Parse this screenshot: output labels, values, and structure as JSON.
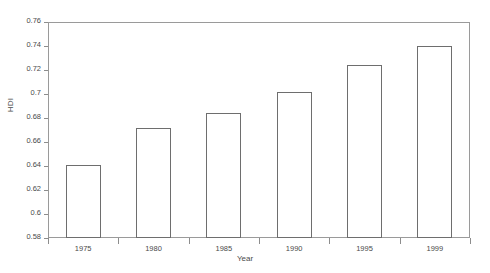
{
  "chart_data": {
    "type": "bar",
    "title": "",
    "xlabel": "Year",
    "ylabel": "HDI",
    "categories": [
      "1975",
      "1980",
      "1985",
      "1990",
      "1995",
      "1999"
    ],
    "values": [
      0.641,
      0.672,
      0.684,
      0.702,
      0.724,
      0.74
    ],
    "ylim": [
      0.58,
      0.76
    ],
    "yticks": [
      "0.58",
      "0.6",
      "0.62",
      "0.64",
      "0.66",
      "0.68",
      "0.7",
      "0.72",
      "0.74",
      "0.76"
    ],
    "ytick_values": [
      0.58,
      0.6,
      0.62,
      0.64,
      0.66,
      0.68,
      0.7,
      0.72,
      0.74,
      0.76
    ],
    "grid": false,
    "legend": null,
    "bar_fill_color": "#ffffff",
    "bar_edge_color": "#6e6e6e",
    "axis_color": "#9a9a9a",
    "text_color": "#4a4a4a",
    "background_color": "#ffffff"
  }
}
